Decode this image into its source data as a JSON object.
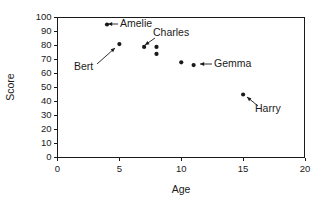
{
  "chart_data": {
    "type": "scatter",
    "title": "",
    "xlabel": "Age",
    "ylabel": "Score",
    "xlim": [
      0,
      20
    ],
    "ylim": [
      0,
      100
    ],
    "xticks": [
      0,
      5,
      10,
      15,
      20
    ],
    "yticks": [
      0,
      10,
      20,
      30,
      40,
      50,
      60,
      70,
      80,
      90,
      100
    ],
    "xtick_labels": [
      "0",
      "5",
      "10",
      "15",
      "20"
    ],
    "ytick_labels": [
      "0",
      "10",
      "20",
      "30",
      "40",
      "50",
      "60",
      "70",
      "80",
      "90",
      "100"
    ],
    "grid": false,
    "legend": "none",
    "marker_color": "#1a1a1a",
    "points": [
      {
        "name": "Amelie",
        "x": 4,
        "y": 95,
        "labeled": true
      },
      {
        "name": "Bert",
        "x": 5,
        "y": 81,
        "labeled": true
      },
      {
        "name": "Charles",
        "x": 7,
        "y": 79,
        "labeled": true
      },
      {
        "name": "",
        "x": 8,
        "y": 79,
        "labeled": false
      },
      {
        "name": "",
        "x": 8,
        "y": 74,
        "labeled": false
      },
      {
        "name": "",
        "x": 10,
        "y": 68,
        "labeled": false
      },
      {
        "name": "Gemma",
        "x": 11,
        "y": 66,
        "labeled": true
      },
      {
        "name": "Harry",
        "x": 15,
        "y": 45,
        "labeled": true
      }
    ],
    "annotations": [
      {
        "text": "Amelie",
        "label_x": 120,
        "label_y": 27,
        "anchor": "start",
        "arrow_from_x": 118,
        "arrow_from_y": 24,
        "arrow_to_x": 108,
        "arrow_to_y": 24
      },
      {
        "text": "Charles",
        "label_x": 153,
        "label_y": 36,
        "anchor": "start",
        "arrow_from_x": 155,
        "arrow_from_y": 38,
        "arrow_to_x": 145,
        "arrow_to_y": 45
      },
      {
        "text": "Bert",
        "label_x": 74,
        "label_y": 70,
        "anchor": "start",
        "arrow_from_x": 97,
        "arrow_from_y": 64,
        "arrow_to_x": 115,
        "arrow_to_y": 48
      },
      {
        "text": "Gemma",
        "label_x": 214,
        "label_y": 67,
        "anchor": "start",
        "arrow_from_x": 212,
        "arrow_from_y": 64,
        "arrow_to_x": 200,
        "arrow_to_y": 64
      },
      {
        "text": "Harry",
        "label_x": 255,
        "label_y": 112,
        "anchor": "start",
        "arrow_from_x": 258,
        "arrow_from_y": 106,
        "arrow_to_x": 247,
        "arrow_to_y": 97
      }
    ]
  }
}
